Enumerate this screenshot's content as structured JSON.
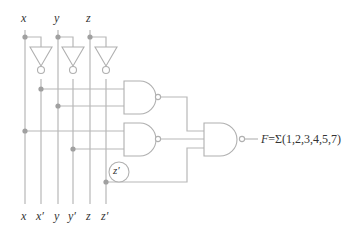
{
  "diagram": {
    "type": "logic-circuit",
    "colors": {
      "wire": "#b8b8b8",
      "gate": "#b0b0b0",
      "dot": "#a0a0a0",
      "text": "#333333"
    },
    "inputs_top": [
      {
        "label": "x"
      },
      {
        "label": "y"
      },
      {
        "label": "z"
      }
    ],
    "rails_bottom": [
      {
        "label": "x"
      },
      {
        "label": "x′"
      },
      {
        "label": "y"
      },
      {
        "label": "y′"
      },
      {
        "label": "z"
      },
      {
        "label": "z′"
      }
    ],
    "gates": [
      {
        "id": "inv-x",
        "type": "NOT",
        "input": "x",
        "output": "x′"
      },
      {
        "id": "inv-y",
        "type": "NOT",
        "input": "y",
        "output": "y′"
      },
      {
        "id": "inv-z",
        "type": "NOT",
        "input": "z",
        "output": "z′"
      },
      {
        "id": "nand-1",
        "type": "NAND",
        "inputs": [
          "x′",
          "y"
        ]
      },
      {
        "id": "nand-2",
        "type": "NAND",
        "inputs": [
          "x",
          "y′"
        ]
      },
      {
        "id": "nand-3",
        "type": "NAND",
        "inputs": [
          "nand-1",
          "nand-2",
          "z′"
        ],
        "output": "F"
      }
    ],
    "annotation": {
      "label": "z′"
    },
    "output": {
      "name": "F",
      "expression": "=Σ(1,2,3,4,5,7)"
    }
  }
}
